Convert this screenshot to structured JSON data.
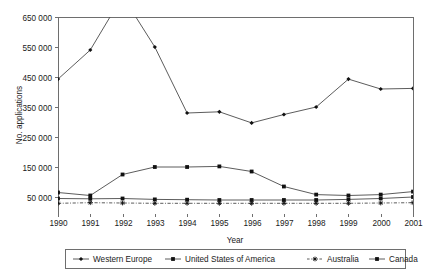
{
  "chart_data": {
    "type": "line",
    "title": "",
    "xlabel": "Year",
    "ylabel": "No. applications",
    "grid": false,
    "legend_position": "bottom",
    "x": [
      1990,
      1991,
      1992,
      1993,
      1994,
      1995,
      1996,
      1997,
      1998,
      1999,
      2000,
      2001
    ],
    "categories": [
      "1990",
      "1991",
      "1992",
      "1993",
      "1994",
      "1995",
      "1996",
      "1997",
      "1998",
      "1999",
      "2000",
      "2001"
    ],
    "xlim": [
      1990,
      2001
    ],
    "ylim": [
      0,
      680000
    ],
    "ytick_labels": [
      "50 000",
      "150 000",
      "250 000",
      "350 000",
      "450 000",
      "550 000",
      "650 000"
    ],
    "ytick_values": [
      50000,
      150000,
      250000,
      350000,
      450000,
      550000,
      650000
    ],
    "note": "Western Europe series is clipped above the 650 000 axis maximum in 1992",
    "series": [
      {
        "name": "Western Europe",
        "marker": "diamond",
        "dashed": false,
        "values": [
          443000,
          540000,
          720000,
          550000,
          330000,
          334000,
          297000,
          325000,
          350000,
          443000,
          410000,
          412000
        ]
      },
      {
        "name": "United States of America",
        "marker": "square",
        "dashed": false,
        "values": [
          65000,
          55000,
          125000,
          150000,
          150000,
          152000,
          135000,
          85000,
          58000,
          55000,
          58000,
          68000
        ]
      },
      {
        "name": "Australia",
        "marker": "star",
        "dashed": true,
        "values": [
          29000,
          31000,
          30000,
          29000,
          29000,
          29000,
          29000,
          29000,
          29000,
          29000,
          30000,
          31000
        ]
      },
      {
        "name": "Canada",
        "marker": "square",
        "dashed": false,
        "values": [
          45000,
          44000,
          45000,
          42000,
          41000,
          40000,
          40000,
          40000,
          40000,
          42000,
          45000,
          50000
        ]
      }
    ]
  },
  "legend": {
    "entries": [
      {
        "label": "Western Europe"
      },
      {
        "label": "United States of America"
      },
      {
        "label": "Australia"
      },
      {
        "label": "Canada"
      }
    ]
  },
  "axes": {
    "y_title": "No. applications",
    "x_title": "Year"
  }
}
